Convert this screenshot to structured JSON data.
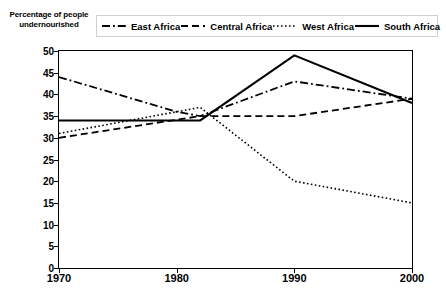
{
  "axis_title": "Percentage of people undernourished",
  "legend": {
    "items": [
      {
        "label": "East Africa",
        "dash": "dash-dot",
        "name": "legend-item-east-africa"
      },
      {
        "label": "Central Africa",
        "dash": "dashed",
        "name": "legend-item-central-africa"
      },
      {
        "label": "West Africa",
        "dash": "dotted",
        "name": "legend-item-west-africa"
      },
      {
        "label": "South Africa",
        "dash": "solid",
        "name": "legend-item-south-africa"
      }
    ]
  },
  "chart_data": {
    "type": "line",
    "title": "",
    "subtitle": "",
    "xlabel": "",
    "ylabel": "Percentage of people undernourished",
    "x": [
      1970,
      1980,
      1990,
      2000
    ],
    "xlim": [
      1970,
      2000
    ],
    "ylim": [
      0,
      50
    ],
    "ytick_labels": [
      "50",
      "45",
      "40",
      "35",
      "30",
      "25",
      "20",
      "15",
      "10",
      "5",
      "0"
    ],
    "ytick_values": [
      50,
      45,
      40,
      35,
      30,
      25,
      20,
      15,
      10,
      5,
      0
    ],
    "xtick_labels": [
      "1970",
      "1980",
      "1990",
      "2000"
    ],
    "grid": false,
    "legend_position": "top",
    "line_color": "#000000",
    "series": [
      {
        "name": "East Africa",
        "style": "dash-dot",
        "values": [
          44,
          36,
          43,
          39
        ],
        "points": [
          {
            "x": 1970,
            "y": 44
          },
          {
            "x": 1980,
            "y": 36
          },
          {
            "x": 1982,
            "y": 35
          },
          {
            "x": 1990,
            "y": 43
          },
          {
            "x": 2000,
            "y": 39
          }
        ]
      },
      {
        "name": "Central Africa",
        "style": "dashed",
        "values": [
          30,
          35,
          35,
          39
        ],
        "points": [
          {
            "x": 1970,
            "y": 30
          },
          {
            "x": 1982,
            "y": 35
          },
          {
            "x": 1990,
            "y": 35
          },
          {
            "x": 2000,
            "y": 39
          }
        ]
      },
      {
        "name": "West Africa",
        "style": "dotted",
        "values": [
          31,
          36,
          20,
          15
        ],
        "points": [
          {
            "x": 1970,
            "y": 31
          },
          {
            "x": 1980,
            "y": 36
          },
          {
            "x": 1982,
            "y": 37
          },
          {
            "x": 1990,
            "y": 20
          },
          {
            "x": 2000,
            "y": 15
          }
        ]
      },
      {
        "name": "South Africa",
        "style": "solid",
        "values": [
          34,
          34,
          49,
          38
        ],
        "points": [
          {
            "x": 1970,
            "y": 34
          },
          {
            "x": 1982,
            "y": 34
          },
          {
            "x": 1990,
            "y": 49
          },
          {
            "x": 2000,
            "y": 38
          }
        ]
      }
    ]
  }
}
